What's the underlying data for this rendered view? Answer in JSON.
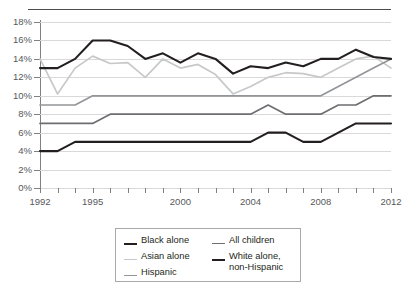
{
  "title": "",
  "legend": {
    "items": [
      {
        "label": "Black alone",
        "color": "#231f20",
        "width": 2.1
      },
      {
        "label": "Asian alone",
        "color": "#c7c8ca",
        "width": 1.7
      },
      {
        "label": "Hispanic",
        "color": "#939598",
        "width": 1.7
      },
      {
        "label": "All children",
        "color": "#6d6e71",
        "width": 1.7
      },
      {
        "label": "White alone, non-Hispanic",
        "color": "#231f20",
        "width": 2.1
      }
    ]
  },
  "chart_data": {
    "type": "line",
    "title": "",
    "xlabel": "",
    "ylabel": "",
    "xlim": [
      1992,
      2012
    ],
    "ylim": [
      0,
      18
    ],
    "grid": true,
    "legend_position": "bottom",
    "ytick_labels": [
      "0%",
      "2%",
      "4%",
      "6%",
      "8%",
      "10%",
      "12%",
      "14%",
      "16%",
      "18%"
    ],
    "ytick_values": [
      0,
      2,
      4,
      6,
      8,
      10,
      12,
      14,
      16,
      18
    ],
    "xtick_values": [
      1992,
      1993,
      1994,
      1995,
      1996,
      1997,
      1998,
      1999,
      2000,
      2001,
      2002,
      2003,
      2004,
      2005,
      2006,
      2007,
      2008,
      2009,
      2010,
      2011,
      2012
    ],
    "xtick_labels": [
      {
        "value": 1992,
        "label": "1992"
      },
      {
        "value": 1995,
        "label": "1995"
      },
      {
        "value": 2000,
        "label": "2000"
      },
      {
        "value": 2004,
        "label": "2004"
      },
      {
        "value": 2008,
        "label": "2008"
      },
      {
        "value": 2012,
        "label": "2012"
      }
    ],
    "x": [
      1992,
      1993,
      1994,
      1995,
      1996,
      1997,
      1998,
      1999,
      2000,
      2001,
      2002,
      2003,
      2004,
      2005,
      2006,
      2007,
      2008,
      2009,
      2010,
      2011,
      2012
    ],
    "series": [
      {
        "name": "Black alone",
        "color": "#231f20",
        "width": 2.1,
        "values": [
          13,
          13,
          14,
          16,
          16,
          15.4,
          14,
          14.6,
          13.6,
          14.6,
          14,
          12.4,
          13.2,
          13,
          13.6,
          13.2,
          14,
          14,
          15,
          14.2,
          14
        ]
      },
      {
        "name": "Asian alone",
        "color": "#c7c8ca",
        "width": 1.7,
        "values": [
          14,
          10.2,
          13,
          14.3,
          13.5,
          13.6,
          12,
          14,
          13,
          13.4,
          12.3,
          10.2,
          11,
          12,
          12.5,
          12.4,
          12,
          13,
          14,
          14.3,
          13
        ]
      },
      {
        "name": "Hispanic",
        "color": "#939598",
        "width": 1.7,
        "values": [
          9,
          9,
          9,
          10,
          10,
          10,
          10,
          10,
          10,
          10,
          10,
          10,
          10,
          10,
          10,
          10,
          10,
          11,
          12,
          13,
          14
        ]
      },
      {
        "name": "All children",
        "color": "#6d6e71",
        "width": 1.7,
        "values": [
          7,
          7,
          7,
          7,
          8,
          8,
          8,
          8,
          8,
          8,
          8,
          8,
          8,
          9,
          8,
          8,
          8,
          9,
          9,
          10,
          10
        ]
      },
      {
        "name": "White alone, non-Hispanic",
        "color": "#231f20",
        "width": 2.1,
        "values": [
          4,
          4,
          5,
          5,
          5,
          5,
          5,
          5,
          5,
          5,
          5,
          5,
          5,
          6,
          6,
          5,
          5,
          6,
          7,
          7,
          7
        ]
      }
    ]
  }
}
